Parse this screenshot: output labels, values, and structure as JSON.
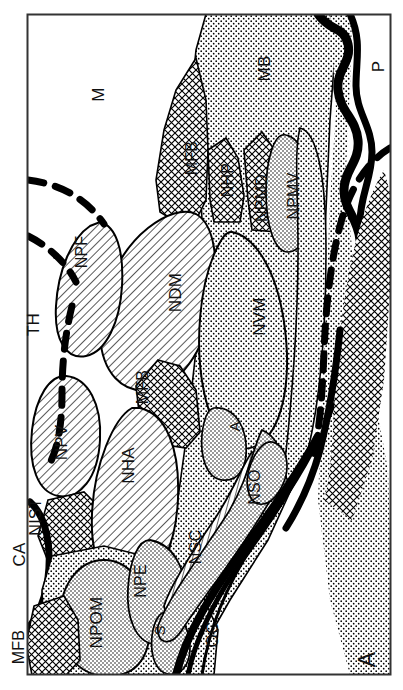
{
  "figure": {
    "panel_label": "A",
    "orientation": "labels rotated 90 degrees counter-clockwise"
  },
  "labels": {
    "M": "M",
    "MB": "MB",
    "P": "P",
    "MFB_upper": "MFB",
    "NHP": "NHP",
    "NPMD": "NPMD",
    "NPMV": "NPMV",
    "NPF": "NPF",
    "NDM": "NDM",
    "NVM": "NVM",
    "TH": "TH",
    "MFB_mid": "MFB",
    "A_mid": "A",
    "NPV": "NPV",
    "NIST": "NIST",
    "CA": "CA",
    "NHA": "NHA",
    "A_low": "A",
    "NSO": "NSO",
    "NSC": "NSC",
    "NPE": "NPE",
    "S": "S",
    "NPOM": "NPOM",
    "MFB_lower": "MFB",
    "OC": "OC"
  },
  "label_list": [
    {
      "id": "M",
      "text": "M",
      "x": 98,
      "y": 92,
      "size": 17,
      "rot": -90
    },
    {
      "id": "MB",
      "text": "MB",
      "x": 262,
      "y": 68,
      "size": 17,
      "rot": -90
    },
    {
      "id": "P",
      "text": "P",
      "x": 379,
      "y": 64,
      "size": 17,
      "rot": -90
    },
    {
      "id": "MFB-upper",
      "text": "MFB",
      "x": 193,
      "y": 156,
      "size": 16,
      "rot": -90
    },
    {
      "id": "NHP",
      "text": "NHP",
      "x": 228,
      "y": 178,
      "size": 16,
      "rot": -90
    },
    {
      "id": "NPMD",
      "text": "NPMD",
      "x": 263,
      "y": 192,
      "size": 16,
      "rot": -90
    },
    {
      "id": "NPMV",
      "text": "NPMV",
      "x": 294,
      "y": 190,
      "size": 16,
      "rot": -90
    },
    {
      "id": "NPF",
      "text": "NPF",
      "x": 81,
      "y": 250,
      "size": 16,
      "rot": -90
    },
    {
      "id": "NDM",
      "text": "NDM",
      "x": 175,
      "y": 290,
      "size": 17,
      "rot": -90
    },
    {
      "id": "NVM",
      "text": "NVM",
      "x": 258,
      "y": 315,
      "size": 17,
      "rot": -90
    },
    {
      "id": "TH",
      "text": "TH",
      "x": 30,
      "y": 322,
      "size": 17,
      "rot": -90
    },
    {
      "id": "MFB-mid",
      "text": "MFB",
      "x": 143,
      "y": 385,
      "size": 16,
      "rot": -90
    },
    {
      "id": "A-mid",
      "text": "A",
      "x": 233,
      "y": 424,
      "size": 15,
      "rot": -90
    },
    {
      "id": "NPV",
      "text": "NPV",
      "x": 61,
      "y": 440,
      "size": 17,
      "rot": -90
    },
    {
      "id": "NIST",
      "text": "NIST",
      "x": 35,
      "y": 515,
      "size": 16,
      "rot": -90
    },
    {
      "id": "CA",
      "text": "CA",
      "x": 15,
      "y": 552,
      "size": 17,
      "rot": -90
    },
    {
      "id": "NHA",
      "text": "NHA",
      "x": 128,
      "y": 463,
      "size": 17,
      "rot": -90
    },
    {
      "id": "A-low",
      "text": "A",
      "x": 228,
      "y": 430,
      "size": 15,
      "rot": -90
    },
    {
      "id": "NSO",
      "text": "NSO",
      "x": 254,
      "y": 485,
      "size": 16,
      "rot": -90
    },
    {
      "id": "NSC",
      "text": "NSC",
      "x": 196,
      "y": 545,
      "size": 16,
      "rot": -90
    },
    {
      "id": "NPE",
      "text": "NPE",
      "x": 141,
      "y": 579,
      "size": 16,
      "rot": -90
    },
    {
      "id": "S",
      "text": "S",
      "x": 158,
      "y": 627,
      "size": 15,
      "rot": -90
    },
    {
      "id": "NPOM",
      "text": "NPOM",
      "x": 92,
      "y": 618,
      "size": 17,
      "rot": -90
    },
    {
      "id": "MFB-lower",
      "text": "MFB",
      "x": 18,
      "y": 645,
      "size": 16,
      "rot": -90
    },
    {
      "id": "OC",
      "text": "OC",
      "x": 210,
      "y": 632,
      "size": 17,
      "rot": -90
    },
    {
      "id": "panel-A",
      "text": "A",
      "x": 368,
      "y": 655,
      "size": 23,
      "rot": -90
    }
  ],
  "colors": {
    "ink": "#000000",
    "background": "#ffffff",
    "stipple": "#000000",
    "hatch": "#000000"
  }
}
